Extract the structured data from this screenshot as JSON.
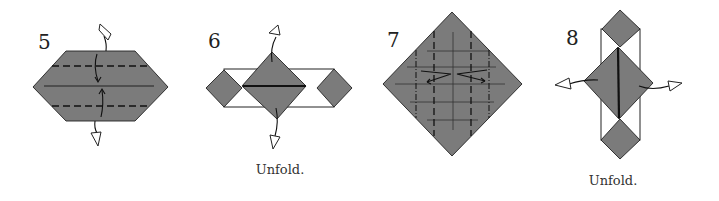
{
  "diagram": {
    "type": "origami-instructions",
    "paper_color": "#7b7b7b",
    "steps": [
      {
        "number": "5",
        "caption": "",
        "shape": "hexagon",
        "marks": [
          "two horizontal valley folds",
          "center crease",
          "fold arrows inward",
          "open unfold arrows up and down"
        ]
      },
      {
        "number": "6",
        "caption": "Unfold.",
        "shape": "three diamonds with white rectangle outline",
        "marks": [
          "unfold arrows up and down"
        ]
      },
      {
        "number": "7",
        "caption": "",
        "shape": "large diamond",
        "marks": [
          "crease grid",
          "vertical valley and mountain folds",
          "pleat arrows left and right"
        ]
      },
      {
        "number": "8",
        "caption": "Unfold.",
        "shape": "vertical stack of diamonds with white rectangle outline",
        "marks": [
          "unfold arrows left and right"
        ]
      }
    ]
  }
}
